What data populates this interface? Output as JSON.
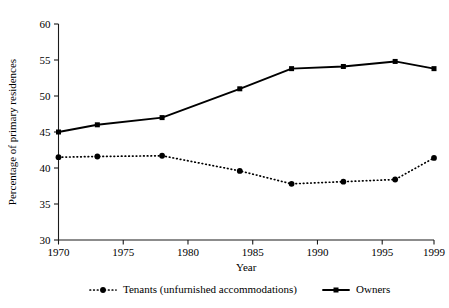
{
  "chart_data": {
    "type": "line",
    "title": "",
    "xlabel": "Year",
    "ylabel": "Percentage of primary residences",
    "xlim": [
      1970,
      1999
    ],
    "ylim": [
      30,
      60
    ],
    "grid": false,
    "legend_position": "bottom",
    "y_ticks": [
      30,
      35,
      40,
      45,
      50,
      55,
      60
    ],
    "x_ticks": [
      1970,
      1975,
      1980,
      1985,
      1990,
      1995,
      1999
    ],
    "x": [
      1970,
      1973,
      1978,
      1984,
      1988,
      1992,
      1996,
      1999
    ],
    "series": [
      {
        "name": "Tenants (unfurnished accommodations)",
        "marker": "circle",
        "line_style": "dotted",
        "values": [
          41.5,
          41.6,
          41.7,
          39.6,
          37.8,
          38.1,
          38.4,
          41.4
        ]
      },
      {
        "name": "Owners",
        "marker": "square",
        "line_style": "solid",
        "values": [
          45.0,
          46.0,
          47.0,
          51.0,
          53.8,
          54.1,
          54.8,
          53.8
        ]
      }
    ]
  },
  "legend": {
    "items": [
      {
        "label": "Tenants (unfurnished accommodations)",
        "marker": "circle",
        "line_style": "dotted"
      },
      {
        "label": "Owners",
        "marker": "square",
        "line_style": "solid"
      }
    ]
  },
  "colors": {
    "ink": "#000000",
    "axis": "#1a1a1a",
    "background": "#ffffff"
  }
}
